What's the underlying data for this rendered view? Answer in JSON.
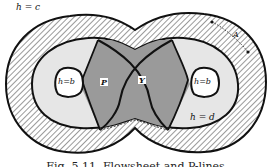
{
  "diagram": {
    "colors": {
      "background": "#ffffff",
      "outline": "#111111",
      "hatch_stroke": "#555555",
      "light_region": "#e6e6e6",
      "dark_region": "#9a9a9a",
      "hole": "#ffffff"
    },
    "labels": {
      "outer_boundary": "h = c",
      "inner_boundary": "h = d",
      "left_hole": "h=b",
      "right_hole": "h=b",
      "point_p": "P",
      "point_y": "Y",
      "width_marker": "A"
    },
    "regions": [
      {
        "name": "hatched-band",
        "description": "region between h = c and h = d"
      },
      {
        "name": "light-region",
        "description": "interior between h = d and dark lobes"
      },
      {
        "name": "dark-lobes",
        "description": "shaded regions around P and Y"
      },
      {
        "name": "left-hole",
        "description": "h=b"
      },
      {
        "name": "right-hole",
        "description": "h=b"
      }
    ],
    "caption": "Fig. 5.11. Flowsheet and P-lines"
  }
}
